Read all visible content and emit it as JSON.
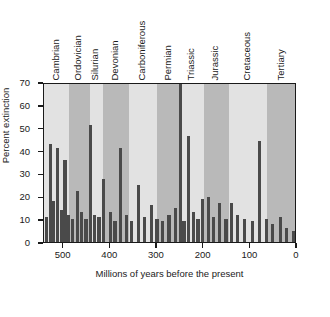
{
  "chart_data": {
    "type": "bar",
    "title": "",
    "xlabel": "Millions of years before the present",
    "ylabel": "Percent extinction",
    "xlim": [
      542,
      0
    ],
    "ylim": [
      0,
      70
    ],
    "xticks": [
      500,
      400,
      300,
      200,
      100,
      0
    ],
    "yticks": [
      0,
      10,
      20,
      30,
      40,
      50,
      60,
      70
    ],
    "grid": false,
    "legend": "none",
    "x_axis_reversed": true,
    "bar_color": "#4a4a4a",
    "band_color_light": "#e2e2e2",
    "band_color_dark": "#b9b9b9",
    "note_clipped_bar": "Permian bar exceeds the 70% axis maximum and is clipped at the plot top",
    "periods": [
      {
        "name": "Cambrian",
        "start": 542,
        "end": 488
      },
      {
        "name": "Ordovician",
        "start": 488,
        "end": 444
      },
      {
        "name": "Silurian",
        "start": 444,
        "end": 416
      },
      {
        "name": "Devonian",
        "start": 416,
        "end": 359
      },
      {
        "name": "Carboniferous",
        "start": 359,
        "end": 299
      },
      {
        "name": "Permian",
        "start": 299,
        "end": 251
      },
      {
        "name": "Triassic",
        "start": 251,
        "end": 200
      },
      {
        "name": "Jurassic",
        "start": 200,
        "end": 146
      },
      {
        "name": "Cretaceous",
        "start": 146,
        "end": 65
      },
      {
        "name": "Tertiary",
        "start": 65,
        "end": 0
      }
    ],
    "x": [
      536,
      528,
      521,
      513,
      505,
      497,
      489,
      481,
      470,
      462,
      452,
      443,
      434,
      424,
      414,
      400,
      390,
      378,
      366,
      354,
      340,
      326,
      312,
      300,
      288,
      274,
      260,
      250,
      242,
      232,
      222,
      212,
      202,
      190,
      178,
      166,
      152,
      140,
      128,
      112,
      96,
      80,
      66,
      52,
      36,
      22,
      8
    ],
    "values": [
      11,
      43,
      18,
      41,
      14,
      36,
      12,
      10,
      22.5,
      13,
      10,
      51,
      12,
      11,
      27.5,
      13,
      9,
      41,
      12,
      9,
      25,
      11,
      16,
      10,
      9,
      12,
      15,
      96,
      9,
      46.5,
      13,
      10,
      19,
      19.5,
      11,
      17,
      10,
      17,
      12,
      10,
      9,
      44,
      10,
      8,
      11,
      6,
      5
    ],
    "series_name": "Percent extinction of marine genera"
  }
}
